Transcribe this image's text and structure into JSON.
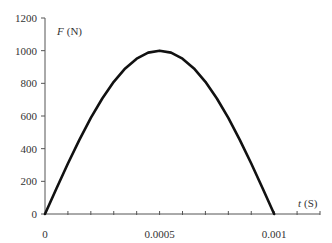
{
  "chart_data": {
    "type": "line",
    "title": "",
    "xlabel": "t (S)",
    "xlabel_var": "t",
    "xlabel_unit": "(S)",
    "ylabel": "F (N)",
    "ylabel_var": "F",
    "ylabel_unit": "(N)",
    "xlim": [
      0,
      0.0012
    ],
    "ylim": [
      0,
      1200
    ],
    "x_tick_labels": [
      "0",
      "0.0005",
      "0.001"
    ],
    "x_tick_values": [
      0,
      0.0005,
      0.001
    ],
    "x_minor_tick_step": 0.0001,
    "y_tick_labels": [
      "0",
      "200",
      "400",
      "600",
      "800",
      "1000",
      "1200"
    ],
    "y_tick_values": [
      0,
      200,
      400,
      600,
      800,
      1000,
      1200
    ],
    "grid": false,
    "legend": null,
    "series": [
      {
        "name": "F(t)",
        "description": "Half-sine force pulse, F = 1000 sin(pi t / 0.001)",
        "color": "#111111",
        "x": [
          0,
          5e-05,
          0.0001,
          0.00015,
          0.0002,
          0.00025,
          0.0003,
          0.00035,
          0.0004,
          0.00045,
          0.0005,
          0.00055,
          0.0006,
          0.00065,
          0.0007,
          0.00075,
          0.0008,
          0.00085,
          0.0009,
          0.00095,
          0.001
        ],
        "y": [
          0,
          156,
          309,
          454,
          588,
          707,
          809,
          891,
          951,
          988,
          1000,
          988,
          951,
          891,
          809,
          707,
          588,
          454,
          309,
          156,
          0
        ]
      }
    ]
  }
}
